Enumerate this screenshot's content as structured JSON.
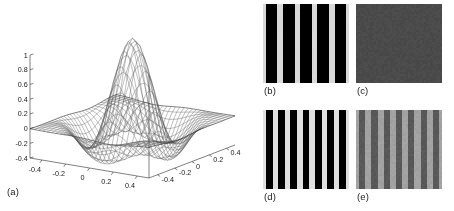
{
  "figure": {
    "panel_count": 5,
    "background_color": "#ffffff"
  },
  "chart_data": [
    {
      "id": "a",
      "type": "surface",
      "caption": "(a)",
      "title": "",
      "xlabel": "",
      "ylabel": "",
      "zlabel": "",
      "grid": true,
      "legend": "none",
      "xlim": [
        -0.5,
        0.5
      ],
      "ylim": [
        -0.5,
        0.5
      ],
      "zlim": [
        -0.4,
        1.0
      ],
      "x_ticks": [
        "-0.4",
        "-0.2",
        "0",
        "0.2",
        "0.4"
      ],
      "x_tick_values": [
        -0.4,
        -0.2,
        0,
        0.2,
        0.4
      ],
      "y_ticks": [
        "-0.4",
        "-0.2",
        "0",
        "0.2",
        "0.4"
      ],
      "y_tick_values": [
        -0.4,
        -0.2,
        0,
        0.2,
        0.4
      ],
      "z_ticks": [
        "1",
        "0.8",
        "0.6",
        "0.4",
        "0.2",
        "0",
        "-0.2",
        "-0.4"
      ],
      "z_tick_values": [
        1,
        0.8,
        0.6,
        0.4,
        0.2,
        0,
        -0.2,
        -0.4
      ],
      "mesh_divisions": 28,
      "peak_value": 1.0,
      "peak_x": 0.0,
      "peak_y": 0.0,
      "trough_value": -0.35,
      "description": "wireframe mesh surface, central gaussian-like peak reaching 1 with surrounding negative ring near -0.3"
    },
    {
      "id": "b",
      "type": "image",
      "caption": "(b)",
      "pattern": "square-wave-grating",
      "cycles": 5,
      "orientation": "vertical",
      "contrast": 1.0,
      "dark_color": "#000000",
      "light_color": "#d9d9d9",
      "duty_cycle": 0.68
    },
    {
      "id": "c",
      "type": "image",
      "caption": "(c)",
      "pattern": "uniform-noise",
      "cycles": 0,
      "orientation": "none",
      "contrast": 0.0,
      "mean_color": "#4a4a4a",
      "noise_amplitude": 0.05
    },
    {
      "id": "d",
      "type": "image",
      "caption": "(d)",
      "pattern": "square-wave-grating",
      "cycles": 7,
      "orientation": "vertical",
      "contrast": 1.0,
      "dark_color": "#000000",
      "light_color": "#e0e0e0",
      "duty_cycle": 0.55
    },
    {
      "id": "e",
      "type": "image",
      "caption": "(e)",
      "pattern": "square-wave-grating",
      "cycles": 7,
      "orientation": "vertical",
      "contrast": 0.28,
      "dark_color": "#585858",
      "light_color": "#a2a2a2",
      "duty_cycle": 0.5
    }
  ]
}
